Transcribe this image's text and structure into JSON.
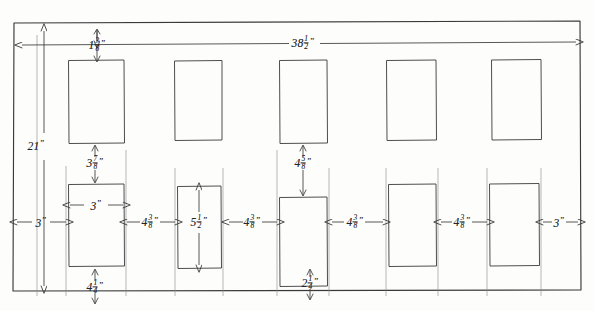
{
  "drawing": {
    "title": "Dimensioned panel layout",
    "style": "hand-drawn technical sketch",
    "units": "inches",
    "line_color": "#3a3a3a",
    "background_color": "#fdfdfc",
    "panel": {
      "name": "outer-panel",
      "overall_width": "38½\"",
      "overall_height": "21\""
    },
    "dimensions": {
      "overall_width": {
        "label_whole": "38",
        "label_num": "1",
        "label_den": "2",
        "value": 38.5,
        "text": "38½\""
      },
      "overall_height": {
        "label_whole": "21",
        "value": 21,
        "text": "21\""
      },
      "top_margin": {
        "label_whole": "1",
        "label_num": "3",
        "label_den": "8",
        "value": 1.375,
        "text": "1⅜\""
      },
      "gap_below_top_left": {
        "label_whole": "3",
        "label_num": "7",
        "label_den": "8",
        "value": 3.875,
        "text": "3⅞\""
      },
      "gap_below_top_center": {
        "label_whole": "4",
        "label_num": "5",
        "label_den": "8",
        "value": 4.625,
        "text": "4⅝\""
      },
      "left_margin": {
        "label_whole": "3",
        "value": 3,
        "text": "3\""
      },
      "right_margin": {
        "label_whole": "3",
        "value": 3,
        "text": "3\""
      },
      "rect_width": {
        "label_whole": "3",
        "value": 3,
        "text": "3\""
      },
      "rect_height": {
        "label_whole": "5",
        "label_num": "1",
        "label_den": "2",
        "value": 5.5,
        "text": "5½\""
      },
      "gap_1": {
        "label_whole": "4",
        "label_num": "3",
        "label_den": "8",
        "value": 4.375,
        "text": "4⅜\""
      },
      "gap_2": {
        "label_whole": "4",
        "label_num": "3",
        "label_den": "8",
        "value": 4.375,
        "text": "4⅜\""
      },
      "gap_3": {
        "label_whole": "4",
        "label_num": "3",
        "label_den": "8",
        "value": 4.375,
        "text": "4⅜\""
      },
      "gap_4": {
        "label_whole": "4",
        "label_num": "3",
        "label_den": "8",
        "value": 4.375,
        "text": "4⅜\""
      },
      "bottom_offset_left": {
        "label_whole": "4",
        "label_num": "1",
        "label_den": "4",
        "value": 4.25,
        "text": "4¼\""
      },
      "bottom_offset_center": {
        "label_whole": "2",
        "label_num": "1",
        "label_den": "4",
        "value": 2.25,
        "text": "2¼\""
      }
    },
    "top_row_rects": [
      {
        "id": "top-rect-1",
        "x": 68,
        "y": 60,
        "w": 56,
        "h": 83
      },
      {
        "id": "top-rect-2",
        "x": 174,
        "y": 60,
        "w": 48,
        "h": 80
      },
      {
        "id": "top-rect-3",
        "x": 279,
        "y": 60,
        "w": 48,
        "h": 83
      },
      {
        "id": "top-rect-4",
        "x": 386,
        "y": 60,
        "w": 50,
        "h": 80
      },
      {
        "id": "top-rect-5",
        "x": 491,
        "y": 60,
        "w": 50,
        "h": 80
      }
    ],
    "bottom_row_rects": [
      {
        "id": "bottom-rect-1",
        "x": 68,
        "y": 184,
        "w": 56,
        "h": 82
      },
      {
        "id": "bottom-rect-2",
        "x": 177,
        "y": 186,
        "w": 44,
        "h": 82
      },
      {
        "id": "bottom-rect-3",
        "x": 279,
        "y": 197,
        "w": 48,
        "h": 89
      },
      {
        "id": "bottom-rect-4",
        "x": 388,
        "y": 184,
        "w": 48,
        "h": 82
      },
      {
        "id": "bottom-rect-5",
        "x": 489,
        "y": 184,
        "w": 50,
        "h": 82
      }
    ]
  }
}
